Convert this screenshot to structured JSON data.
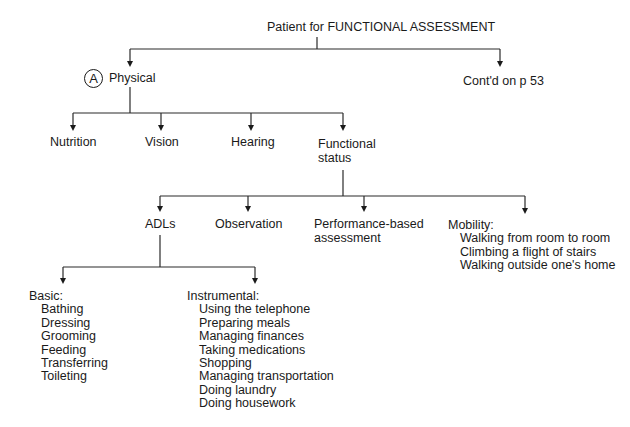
{
  "root": {
    "label": "Patient for FUNCTIONAL ASSESSMENT"
  },
  "physical": {
    "marker": "A",
    "label": "Physical"
  },
  "continued": {
    "label": "Cont'd on p 53"
  },
  "physical_children": [
    {
      "label": "Nutrition"
    },
    {
      "label": "Vision"
    },
    {
      "label": "Hearing"
    },
    {
      "label_line1": "Functional",
      "label_line2": "status"
    }
  ],
  "functional_children": {
    "adls": {
      "label": "ADLs"
    },
    "observation": {
      "label": "Observation"
    },
    "performance": {
      "label_line1": "Performance-based",
      "label_line2": "assessment"
    },
    "mobility": {
      "label": "Mobility:",
      "items": [
        "Walking from room to room",
        "Climbing a flight of stairs",
        "Walking outside one's home"
      ]
    }
  },
  "adl_children": {
    "basic": {
      "label": "Basic:",
      "items": [
        "Bathing",
        "Dressing",
        "Grooming",
        "Feeding",
        "Transferring",
        "Toileting"
      ]
    },
    "instrumental": {
      "label": "Instrumental:",
      "items": [
        "Using the telephone",
        "Preparing meals",
        "Managing finances",
        "Taking medications",
        "Shopping",
        "Managing transportation",
        "Doing laundry",
        "Doing housework"
      ]
    }
  }
}
